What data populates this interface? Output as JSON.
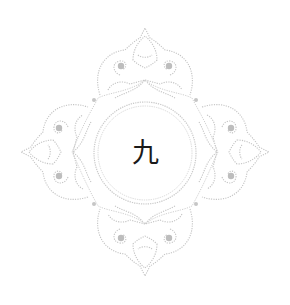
{
  "frame": {
    "center_text": "九",
    "colors": {
      "ornament": "#c8c8c8",
      "ornament_dark": "#b0b0b0",
      "text": "#1a1a1a",
      "background": "#ffffff"
    }
  }
}
